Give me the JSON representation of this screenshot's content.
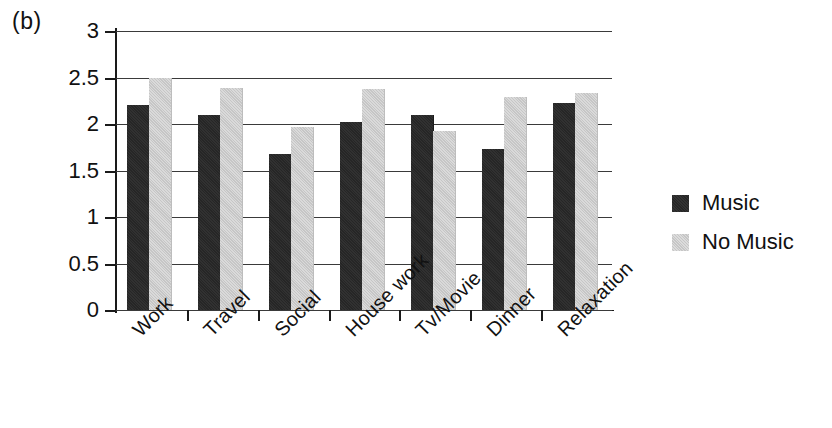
{
  "panel": {
    "label": "(b)"
  },
  "chart_data": {
    "type": "bar",
    "title": "",
    "subtitle": "",
    "xlabel": "",
    "ylabel": "",
    "categories": [
      "Work",
      "Travel",
      "Social",
      "House work",
      "Tv/Movie",
      "Dinner",
      "Relaxation"
    ],
    "series": [
      {
        "name": "Music",
        "color": "#262626",
        "values": [
          2.2,
          2.1,
          1.68,
          2.02,
          2.1,
          1.73,
          2.23
        ]
      },
      {
        "name": "No Music",
        "color": "#c6c6c6",
        "values": [
          2.5,
          2.39,
          1.97,
          2.38,
          1.92,
          2.29,
          2.33
        ]
      }
    ],
    "ylim": [
      0,
      3
    ],
    "ytick_values": [
      0,
      0.5,
      1,
      1.5,
      2,
      2.5,
      3
    ],
    "ytick_labels": [
      "0",
      "0.5",
      "1",
      "1.5",
      "2",
      "2.5",
      "3"
    ],
    "grid": true,
    "grid_axis": "y",
    "legend_position": "right",
    "xtick_label_rotation": -45
  },
  "legend": {
    "entries": [
      {
        "label": "Music"
      },
      {
        "label": "No Music"
      }
    ]
  }
}
